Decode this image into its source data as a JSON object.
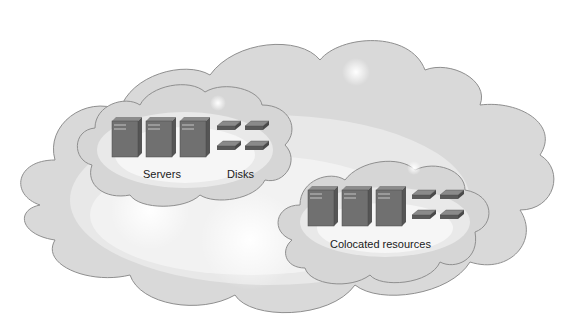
{
  "diagram": {
    "colors": {
      "cloud_outer": "#d8d8d8",
      "cloud_outline": "#9a9a9a",
      "cloud_mid": "#e6e6e6",
      "cloud_inner": "#f6f6f6",
      "server_front": "#6f6f6f",
      "server_side": "#5a5a5a",
      "server_top": "#8c8c8c",
      "disk_top": "#7d7d7d",
      "disk_side": "#555555"
    },
    "outer_cloud": {
      "label": ""
    },
    "groups": [
      {
        "name": "servers-disks-group",
        "servers": 3,
        "disks": 4,
        "labels": {
          "servers": "Servers",
          "disks": "Disks"
        }
      },
      {
        "name": "colocated-group",
        "servers": 3,
        "disks": 4,
        "labels": {
          "group": "Colocated resources"
        }
      }
    ]
  }
}
